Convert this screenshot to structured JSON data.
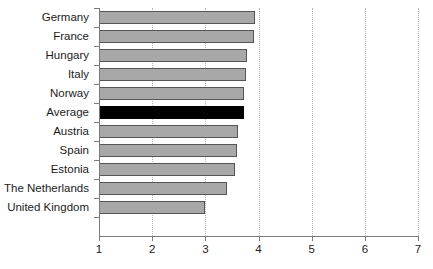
{
  "chart_data": {
    "type": "bar",
    "orientation": "horizontal",
    "title": "",
    "subtitle": "",
    "xlabel": "",
    "ylabel": "",
    "xlim": [
      1,
      7
    ],
    "ylim": null,
    "grid": "vertical-dotted",
    "legend": null,
    "xticks": [
      "1",
      "2",
      "3",
      "4",
      "5",
      "6",
      "7"
    ],
    "xtick_values": [
      1,
      2,
      3,
      4,
      5,
      6,
      7
    ],
    "categories": [
      "Germany",
      "France",
      "Hungary",
      "Italy",
      "Norway",
      "Average",
      "Austria",
      "Spain",
      "Estonia",
      "The Netherlands",
      "United Kingdom"
    ],
    "values": [
      3.93,
      3.92,
      3.78,
      3.76,
      3.73,
      3.72,
      3.62,
      3.6,
      3.56,
      3.4,
      3.0
    ],
    "highlight_category": "Average",
    "colors": {
      "bar_fill": "#a8a8a8",
      "bar_edge": "#555555",
      "highlight_fill": "#000000",
      "axis": "#7a7a7a",
      "gridline": "#b9b9b9",
      "text": "#1c1c1c",
      "background": "#ffffff"
    }
  }
}
